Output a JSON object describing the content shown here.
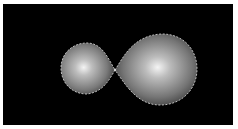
{
  "image": {
    "description": "Two shaded gray spheres with dashed outlines touching at a single point on a black background",
    "background_color": "#000000",
    "border_color": "#ffffff",
    "objects": [
      {
        "name": "small-sphere",
        "highlight_color": "#f0f0f0",
        "shadow_color": "#3a3a3a"
      },
      {
        "name": "large-sphere",
        "highlight_color": "#f0f0f0",
        "shadow_color": "#3a3a3a"
      }
    ],
    "outline_color": "#bfbfbf"
  }
}
